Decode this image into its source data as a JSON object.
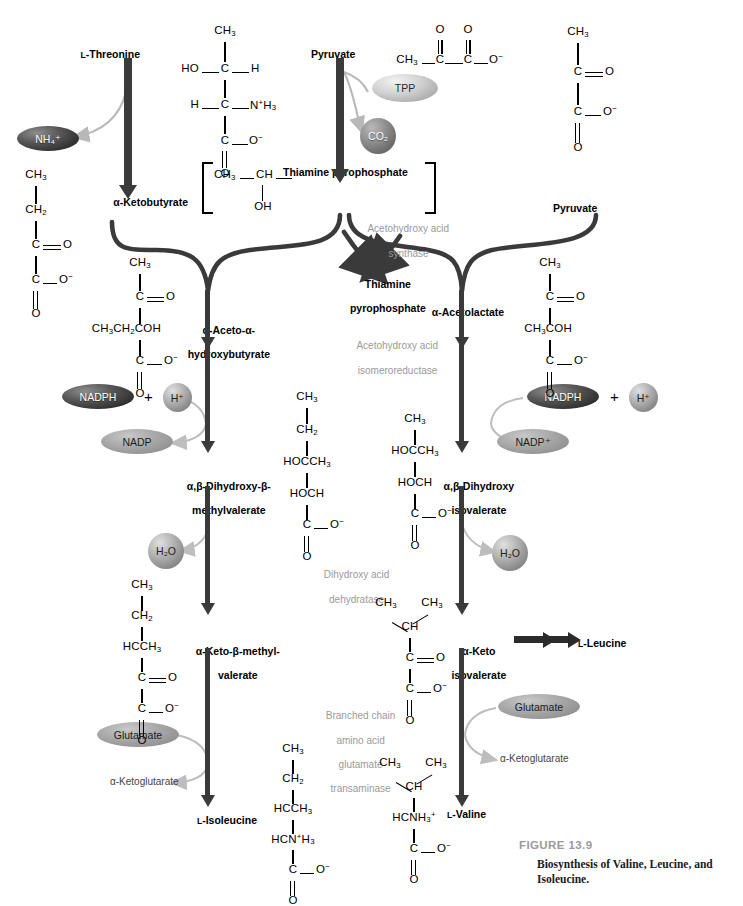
{
  "figure": {
    "number": "FIGURE 13.9",
    "caption_line1": "Biosynthesis of Valine, Leucine, and",
    "caption_line2": "Isoleucine."
  },
  "metabolites": {
    "threonine": "L-Threonine",
    "ketobutyrate": "α-Ketobutyrate",
    "pyruvate_left": "Pyruvate",
    "pyruvate_right": "Pyruvate",
    "thiamine_pyrophosphate_bracket": "Thiamine pyrophosphate",
    "thiamine_pyrophosphate_out_line1": "Thiamine",
    "thiamine_pyrophosphate_out_line2": "pyrophosphate",
    "aceto_hydroxybutyrate_line1": "α-Aceto-α-",
    "aceto_hydroxybutyrate_line2": "hydroxybutyrate",
    "acetolactate": "α-Acetolactate",
    "dihydroxy_methylvalerate_line1": "α,β-Dihydroxy-β-",
    "dihydroxy_methylvalerate_line2": "methylvalerate",
    "dihydroxy_isovalerate_line1": "α,β-Dihydroxy",
    "dihydroxy_isovalerate_line2": "isovalerate",
    "keto_methylvalerate_line1": "α-Keto-β-methyl-",
    "keto_methylvalerate_line2": "valerate",
    "keto_isovalerate_line1": "α-Keto",
    "keto_isovalerate_line2": "isovalerate",
    "isoleucine": "L-Isoleucine",
    "valine": "L-Valine",
    "leucine": "L-Leucine"
  },
  "cofactors": {
    "ammonium": "NH₄⁺",
    "tpp": "TPP",
    "co2": "CO₂",
    "nadph_left": "NADPH",
    "nadph_right": "NADPH",
    "proton_left": "H⁺",
    "proton_right": "H⁺",
    "nadp_left": "NADP",
    "nadp_right": "NADP⁺",
    "water_left": "H₂O",
    "water_right": "H₂O",
    "glutamate_left": "Glutamate",
    "glutamate_right": "Glutamate",
    "ketoglutarate_left": "α-Ketoglutarate",
    "ketoglutarate_right": "α-Ketoglutarate",
    "plus_left": "+",
    "plus_right": "+"
  },
  "enzymes": {
    "acetohydroxy_acid_synthase_line1": "Acetohydroxy acid",
    "acetohydroxy_acid_synthase_line2": "synthase",
    "isomeroreductase_line1": "Acetohydroxy acid",
    "isomeroreductase_line2": "isomeroreductase",
    "dehydratase_line1": "Dihydroxy acid",
    "dehydratase_line2": "dehydratase",
    "transaminase_line1": "Branched chain",
    "transaminase_line2": "amino acid",
    "transaminase_line3": "glutamate",
    "transaminase_line4": "transaminase"
  },
  "structures": {
    "threonine": [
      "CH₃",
      "HO—C—H",
      "H—C—NH₃⁺",
      "C—O⁻",
      "O"
    ],
    "pyruvate": [
      "CH₃",
      "C",
      "O",
      "C",
      "O",
      "O⁻"
    ],
    "hydroxyethyl_tpp": [
      "CH₃",
      "CH",
      "OH"
    ],
    "ketobutyrate": [
      "CH₃",
      "CH₂",
      "C=O",
      "C—O⁻",
      "O"
    ],
    "aceto_hydroxybutyrate": [
      "CH₃",
      "C=O",
      "CH₃CH₂COH",
      "C—O⁻",
      "O"
    ],
    "acetolactate": [
      "CH₃",
      "C=O",
      "CH₃COH",
      "C—O⁻",
      "O"
    ],
    "dihydroxy_methylvalerate": [
      "CH₃",
      "CH₂",
      "HOCCH₃",
      "HOCH",
      "C—O⁻",
      "O"
    ],
    "dihydroxy_isovalerate": [
      "CH₃",
      "HOCCH₃",
      "HOCH",
      "C—O⁻",
      "O"
    ],
    "keto_methylvalerate": [
      "CH₃",
      "CH₂",
      "HCCH₃",
      "C=O",
      "C—O⁻",
      "O"
    ],
    "keto_isovalerate": [
      "CH₃",
      "CH₃",
      "CH",
      "C=O",
      "C—O⁻",
      "O"
    ],
    "isoleucine": [
      "CH₃",
      "CH₂",
      "HCCH₃",
      "HCNH₃⁺",
      "C—O⁻",
      "O"
    ],
    "valine": [
      "CH₃",
      "CH₃",
      "CH",
      "HCNH₃⁺",
      "C—O⁻",
      "O"
    ]
  },
  "atoms": {
    "CH3": "CH",
    "CH2": "CH",
    "C": "C",
    "O": "O",
    "OH": "OH",
    "HO": "HO",
    "H": "H",
    "Ominus": "O",
    "NH3plus": "NH"
  },
  "colors": {
    "arrow": "#3a3a3a",
    "enzyme_text": "#9a9a9a",
    "cofactor_arrow": "#b0b0b0",
    "figure_number": "#9a9a9a",
    "background": "#ffffff"
  }
}
